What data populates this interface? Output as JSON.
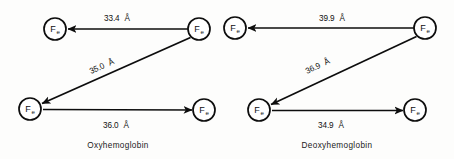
{
  "figure": {
    "background_color": "#fdfdfc",
    "ink_color": "#0d0d0d",
    "atom_symbol": "F",
    "atom_subscript": "e",
    "angstrom_unit": "Å",
    "angstrom_ring": "o",
    "diagrams": [
      {
        "id": "oxyhemoglobin",
        "caption": "Oxyhemoglobin",
        "atoms": [
          {
            "id": "top-left",
            "label": "Fe",
            "cx": 55,
            "cy": 29,
            "r": 11
          },
          {
            "id": "top-right",
            "label": "Fe",
            "cx": 199,
            "cy": 29,
            "r": 11
          },
          {
            "id": "bottom-left",
            "label": "Fe",
            "cx": 30,
            "cy": 109,
            "r": 11
          },
          {
            "id": "bottom-right",
            "label": "Fe",
            "cx": 204,
            "cy": 110,
            "r": 11
          }
        ],
        "bonds": [
          {
            "id": "top-edge",
            "from": "top-right",
            "to": "top-left",
            "distance": "33.4",
            "unit": "Å"
          },
          {
            "id": "diagonal-edge",
            "from": "top-right",
            "to": "bottom-left",
            "distance": "35.0",
            "unit": "Å"
          },
          {
            "id": "bottom-edge",
            "from": "bottom-left",
            "to": "bottom-right",
            "distance": "36.0",
            "unit": "Å"
          }
        ]
      },
      {
        "id": "deoxyhemoglobin",
        "caption": "Deoxyhemoglobin",
        "atoms": [
          {
            "id": "top-left",
            "label": "Fe",
            "cx": 235,
            "cy": 28,
            "r": 11
          },
          {
            "id": "top-right",
            "label": "Fe",
            "cx": 425,
            "cy": 28,
            "r": 11
          },
          {
            "id": "bottom-left",
            "label": "Fe",
            "cx": 259,
            "cy": 110,
            "r": 11
          },
          {
            "id": "bottom-right",
            "label": "Fe",
            "cx": 415,
            "cy": 110,
            "r": 11
          }
        ],
        "bonds": [
          {
            "id": "top-edge",
            "from": "top-right",
            "to": "top-left",
            "distance": "39.9",
            "unit": "Å"
          },
          {
            "id": "diagonal-edge",
            "from": "top-right",
            "to": "bottom-left",
            "distance": "36.9",
            "unit": "Å"
          },
          {
            "id": "bottom-edge",
            "from": "bottom-left",
            "to": "bottom-right",
            "distance": "34.9",
            "unit": "Å"
          }
        ]
      }
    ],
    "labels": {
      "oxy_top": "33.4",
      "oxy_diagonal": "35.0",
      "oxy_bottom": "36.0",
      "deoxy_top": "39.9",
      "deoxy_diagonal": "36.9",
      "deoxy_bottom": "34.9"
    }
  }
}
